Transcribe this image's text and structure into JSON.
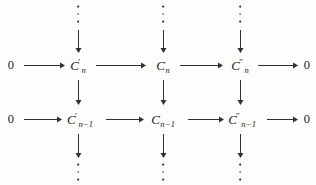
{
  "diagram": {
    "type": "commutative-diagram",
    "background_color": "#fdfdfb",
    "ink_color": "#2f2f2f",
    "columns": [
      {
        "id": "col-left",
        "x": 78,
        "label_base": "C",
        "prime": "′",
        "name": "C-prime"
      },
      {
        "id": "col-middle",
        "x": 163,
        "label_base": "C",
        "prime": "",
        "name": "C"
      },
      {
        "id": "col-right",
        "x": 240,
        "label_base": "C",
        "prime": "″",
        "name": "C-double-prime"
      }
    ],
    "rows": [
      {
        "id": "row-n",
        "y": 65,
        "subscript": "n"
      },
      {
        "id": "row-n-minus-1",
        "y": 119,
        "subscript": "n−1"
      }
    ],
    "zero_label": "0",
    "nodes": {
      "row_n": {
        "left_zero": "0",
        "c_prime_base": "C",
        "c_prime_sup": "′",
        "c_prime_sub": "n",
        "c_base": "C",
        "c_sub": "n",
        "c_dprime_base": "C",
        "c_dprime_sup": "″",
        "c_dprime_sub": "n",
        "right_zero": "0"
      },
      "row_n_minus_1": {
        "left_zero": "0",
        "c_prime_base": "C",
        "c_prime_sup": "′",
        "c_prime_sub": "n−1",
        "c_base": "C",
        "c_sub": "n−1",
        "c_dprime_base": "C",
        "c_dprime_sup": "″",
        "c_dprime_sub": "n−1",
        "right_zero": "0"
      }
    },
    "vertical_dots": {
      "glyph": "⋮",
      "count_per_group": 3,
      "top_positions": [
        78,
        163,
        240
      ],
      "bottom_positions": [
        78,
        163,
        240
      ]
    },
    "arrows": {
      "horizontal_count": 8,
      "vertical_count": 12,
      "style": "solid-with-filled-head"
    }
  }
}
